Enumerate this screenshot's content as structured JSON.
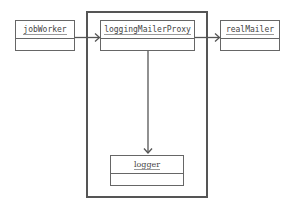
{
  "diagram": {
    "type": "object-collaboration",
    "objects": {
      "jobWorker": {
        "label": "jobWorker"
      },
      "loggingMailerProxy": {
        "label": "loggingMailerProxy"
      },
      "realMailer": {
        "label": "realMailer"
      },
      "logger": {
        "label": "logger"
      }
    },
    "edges": [
      {
        "from": "jobWorker",
        "to": "loggingMailerProxy",
        "style": "open-arrow"
      },
      {
        "from": "loggingMailerProxy",
        "to": "realMailer",
        "style": "open-arrow"
      },
      {
        "from": "loggingMailerProxy",
        "to": "logger",
        "style": "open-arrow"
      }
    ],
    "groups": [
      {
        "name": "proxy-boundary",
        "contains": [
          "loggingMailerProxy",
          "logger"
        ]
      }
    ],
    "colors": {
      "stroke": "#555555",
      "text": "#444444",
      "background": "#ffffff"
    }
  }
}
